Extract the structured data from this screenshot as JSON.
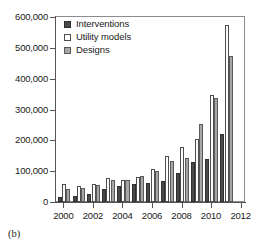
{
  "caption": "(b)",
  "legend": {
    "position": "top-left-inside",
    "entries": [
      {
        "label": "Interventions",
        "swatch": "dark-filled-square",
        "color": "#4a4a4a"
      },
      {
        "label": "Utility models",
        "swatch": "white-open-square",
        "color": "#ffffff"
      },
      {
        "label": "Designs",
        "swatch": "gray-filled-square",
        "color": "#a6a6a6"
      }
    ]
  },
  "chart_data": {
    "type": "bar",
    "title": "",
    "subtitle": "",
    "xlabel": "",
    "ylabel": "",
    "grid": false,
    "legend_position": "top-left-inside",
    "categories": [
      2000,
      2001,
      2002,
      2003,
      2004,
      2005,
      2006,
      2007,
      2008,
      2009,
      2010,
      2011
    ],
    "xtick_labels": [
      "2000",
      "2002",
      "2004",
      "2006",
      "2008",
      "2010",
      "2012"
    ],
    "xtick_values": [
      2000,
      2002,
      2004,
      2006,
      2008,
      2010,
      2012
    ],
    "xlim": [
      1999.5,
      2012.3
    ],
    "ytick_labels": [
      "0",
      "100,000",
      "200,000",
      "300,000",
      "400,000",
      "500,000",
      "600,000"
    ],
    "ytick_values": [
      0,
      100000,
      200000,
      300000,
      400000,
      500000,
      600000
    ],
    "ylim": [
      0,
      600000
    ],
    "series": [
      {
        "name": "Interventions",
        "color": "#4a4a4a",
        "values": [
          16000,
          20000,
          25000,
          41000,
          52000,
          58000,
          61000,
          69000,
          94000,
          129000,
          138000,
          220000
        ]
      },
      {
        "name": "Utility models",
        "color": "#ffffff",
        "values": [
          57000,
          52000,
          58000,
          77000,
          73000,
          81000,
          108000,
          149000,
          178000,
          204000,
          348000,
          573000
        ]
      },
      {
        "name": "Designs",
        "color": "#a6a6a6",
        "values": [
          42000,
          47000,
          56000,
          73000,
          73000,
          85000,
          102000,
          134000,
          143000,
          252000,
          337000,
          472000
        ]
      }
    ]
  }
}
